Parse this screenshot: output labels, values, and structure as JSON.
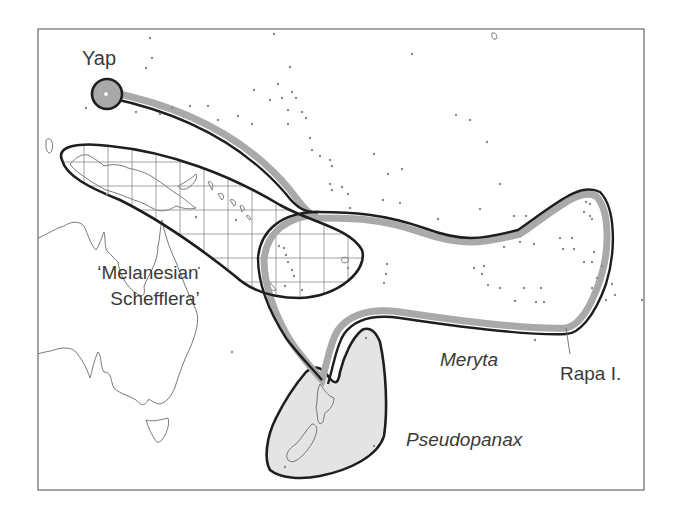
{
  "map": {
    "title": "Distribution map of Pacific Araliaceae groups",
    "colors": {
      "frame": "#6a6a6a",
      "coast": "#6a6a6a",
      "range_outline": "#1e1e1e",
      "meryta_band": "#a9a9a9",
      "pseudopanax_fill": "#e4e4e4",
      "grid": "#8a8a8a",
      "island_dot": "#8a8a8a"
    },
    "labels": {
      "yap": "Yap",
      "melanesian_line1": "‘Melanesian",
      "melanesian_line2": "Schefflera’",
      "meryta": "Meryta",
      "rapa": "Rapa I.",
      "pseudopanax": "Pseudopanax"
    },
    "ranges": [
      {
        "name": "Melanesian Schefflera",
        "style": "grid hatching, black outline"
      },
      {
        "name": "Meryta",
        "style": "grey band with black outline"
      },
      {
        "name": "Pseudopanax",
        "style": "light grey fill with black outline"
      }
    ],
    "places": [
      "Yap",
      "Rapa I."
    ]
  }
}
